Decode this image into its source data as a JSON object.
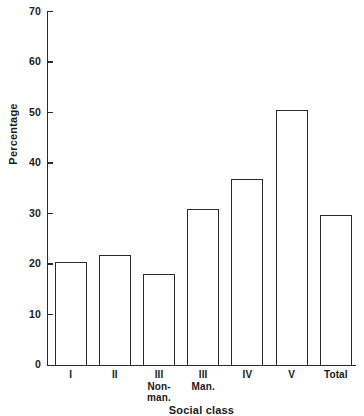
{
  "chart_data": {
    "type": "bar",
    "title": "",
    "xlabel": "Social class",
    "ylabel": "Percentage",
    "categories": [
      "I",
      "II",
      "III Non-man.",
      "III Man.",
      "IV",
      "V",
      "Total"
    ],
    "category_lines": [
      [
        "I"
      ],
      [
        "II"
      ],
      [
        "III",
        "Non-",
        "man."
      ],
      [
        "III",
        "Man."
      ],
      [
        "IV"
      ],
      [
        "V"
      ],
      [
        "Total"
      ]
    ],
    "values": [
      20.4,
      21.8,
      18.0,
      31.0,
      36.8,
      50.6,
      29.8
    ],
    "ylim": [
      0,
      70
    ],
    "yticks": [
      0,
      10,
      20,
      30,
      40,
      50,
      60,
      70
    ],
    "ytick_labels": [
      "0",
      "10",
      "20",
      "30",
      "40",
      "50",
      "60",
      "70"
    ],
    "grid": false,
    "legend": false,
    "bar_fill": "#ffffff",
    "bar_edge": "#2b2b2b",
    "axis_color": "#2b2b2b",
    "background": "#ffffff"
  }
}
